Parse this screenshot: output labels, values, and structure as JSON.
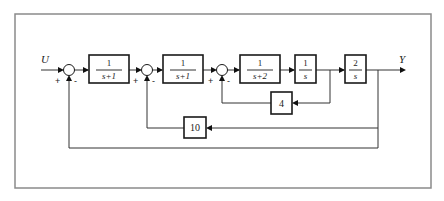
{
  "diagram": {
    "input_label": "U",
    "output_label": "Y",
    "summing_junctions": [
      {
        "id": "sum1",
        "signs": {
          "left": "+",
          "bottom": "-"
        }
      },
      {
        "id": "sum2",
        "signs": {
          "left": "+",
          "bottom": "-"
        }
      },
      {
        "id": "sum3",
        "signs": {
          "left": "+",
          "bottom": "-"
        }
      }
    ],
    "forward_blocks": [
      {
        "id": "G1",
        "numerator": "1",
        "denominator": "s+1"
      },
      {
        "id": "G2",
        "numerator": "1",
        "denominator": "s+1"
      },
      {
        "id": "G3",
        "numerator": "1",
        "denominator": "s+2"
      },
      {
        "id": "G4",
        "numerator": "1",
        "denominator": "s"
      },
      {
        "id": "G5",
        "numerator": "2",
        "denominator": "s"
      }
    ],
    "feedback_blocks": [
      {
        "id": "H1",
        "gain": "4",
        "from": "output of 1/s",
        "to": "sum3"
      },
      {
        "id": "H2",
        "gain": "10",
        "from": "Y",
        "to": "sum2"
      },
      {
        "id": "H3",
        "gain": "1",
        "from": "Y",
        "to": "sum1",
        "note": "unity feedback (direct wire)"
      }
    ]
  }
}
